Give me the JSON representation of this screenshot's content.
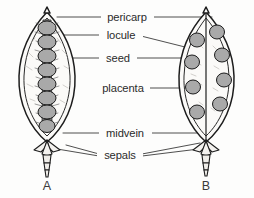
{
  "figure": {
    "background_color": "#fdfdfc",
    "ink_color": "#1d1d1d",
    "seed_fill_color": "#a9a9a9",
    "label_color": "#2b2b2b"
  },
  "labels": [
    {
      "id": "pericarp",
      "text": "pericarp"
    },
    {
      "id": "locule",
      "text": "locule"
    },
    {
      "id": "seed",
      "text": "seed"
    },
    {
      "id": "placenta",
      "text": "placenta"
    },
    {
      "id": "midvein",
      "text": "midvein"
    },
    {
      "id": "sepals",
      "text": "sepals"
    }
  ],
  "specimens": [
    {
      "id": "A",
      "caption": "A",
      "description": "Longitudinal section with axile central placenta bearing a single vertical column of seeds",
      "seed_count": 8,
      "placentation": "axile-central-column"
    },
    {
      "id": "B",
      "caption": "B",
      "description": "Longitudinal section with parietal placentation, seeds borne on the fruit walls in two rows",
      "seed_count": 8,
      "placentation": "parietal-wall"
    }
  ]
}
